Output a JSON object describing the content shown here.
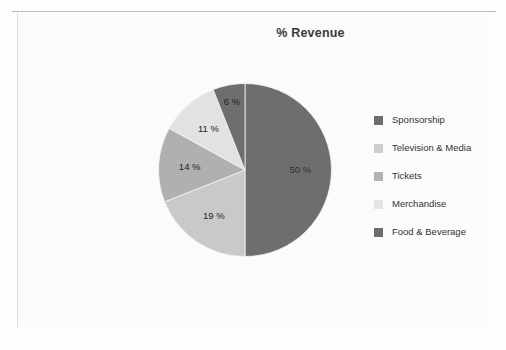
{
  "chart_data": {
    "type": "pie",
    "title": "% Revenue",
    "categories": [
      "Sponsorship",
      "Television & Media",
      "Tickets",
      "Merchandise",
      "Food & Beverage"
    ],
    "values": [
      50,
      19,
      14,
      11,
      6
    ],
    "value_labels": [
      "50 %",
      "19 %",
      "14 %",
      "11 %",
      "6 %"
    ],
    "colors": [
      "#6e6e6e",
      "#c9c9c9",
      "#b0b0b0",
      "#e2e2e2",
      "#6e6e6e"
    ],
    "start_angle_deg": 0,
    "direction": "clockwise",
    "legend_position": "right",
    "grid": false,
    "xlabel": "",
    "ylabel": ""
  },
  "legend": {
    "items": [
      {
        "label": "Sponsorship",
        "color": "#6e6e6e"
      },
      {
        "label": "Television & Media",
        "color": "#cdcdcd"
      },
      {
        "label": "Tickets",
        "color": "#b2b2b2"
      },
      {
        "label": "Merchandise",
        "color": "#e4e4e4"
      },
      {
        "label": "Food & Beverage",
        "color": "#6c6c6c"
      }
    ]
  }
}
